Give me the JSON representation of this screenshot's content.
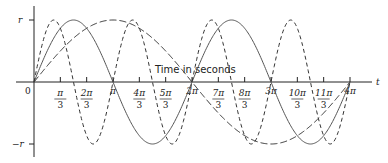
{
  "chart_data": {
    "type": "line",
    "title": "",
    "xlabel": "Time in seconds",
    "axis_end_label": "t",
    "ylabel": "",
    "origin_label": "0",
    "ytick_labels": [
      "r",
      "−r"
    ],
    "xtick_labels": [
      {
        "num": "π",
        "den": "3"
      },
      {
        "num": "2π",
        "den": "3"
      },
      {
        "num": "π",
        "den": ""
      },
      {
        "num": "4π",
        "den": "3"
      },
      {
        "num": "5π",
        "den": "3"
      },
      {
        "num": "2π",
        "den": ""
      },
      {
        "num": "7π",
        "den": "3"
      },
      {
        "num": "8π",
        "den": "3"
      },
      {
        "num": "3π",
        "den": ""
      },
      {
        "num": "10π",
        "den": "3"
      },
      {
        "num": "11π",
        "den": "3"
      },
      {
        "num": "4π",
        "den": ""
      }
    ],
    "xlim": [
      0,
      12.566
    ],
    "ylim": [
      -1,
      1
    ],
    "grid": false,
    "legend": null,
    "series": [
      {
        "name": "r sin(t/2)",
        "style": "long-dash",
        "frequency": 0.5,
        "amplitude": 1
      },
      {
        "name": "r sin(t)",
        "style": "solid",
        "frequency": 1,
        "amplitude": 1
      },
      {
        "name": "r sin(2t)",
        "style": "dashed",
        "frequency": 2,
        "amplitude": 1
      }
    ]
  },
  "layout": {
    "origin_x": 34,
    "axis_y": 82,
    "px_per_pi": 79,
    "amplitude_px": 62
  }
}
